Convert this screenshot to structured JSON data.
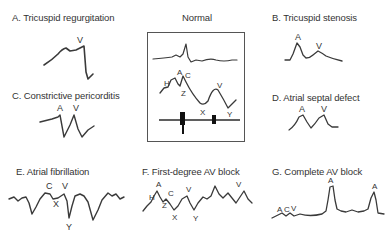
{
  "panels": {
    "a": {
      "title": "A. Tricuspid regurgitation",
      "labels": [
        "V"
      ]
    },
    "normal": {
      "title": "Normal",
      "labels": [
        "H",
        "A",
        "C",
        "Z",
        "V",
        "X",
        "Y"
      ]
    },
    "b": {
      "title": "B. Tricuspid stenosis",
      "labels": [
        "A",
        "V"
      ]
    },
    "c": {
      "title": "C. Constrictive pericorditis",
      "labels": [
        "A",
        "V"
      ]
    },
    "d": {
      "title": "D. Atrial septal defect",
      "labels": [
        "A",
        "V"
      ]
    },
    "e": {
      "title": "E. Atrial fibrillation",
      "labels": [
        "C",
        "V",
        "X",
        "Y"
      ]
    },
    "f": {
      "title": "F. First-degree AV block",
      "labels": [
        "H",
        "A",
        "C",
        "V",
        "Z",
        "X",
        "Y",
        "V"
      ]
    },
    "g": {
      "title": "G. Complete AV block",
      "labels": [
        "A",
        "C",
        "V",
        "A",
        "A"
      ]
    }
  },
  "colors": {
    "stroke": "#3a3a3a",
    "text": "#333333",
    "background": "#ffffff"
  }
}
